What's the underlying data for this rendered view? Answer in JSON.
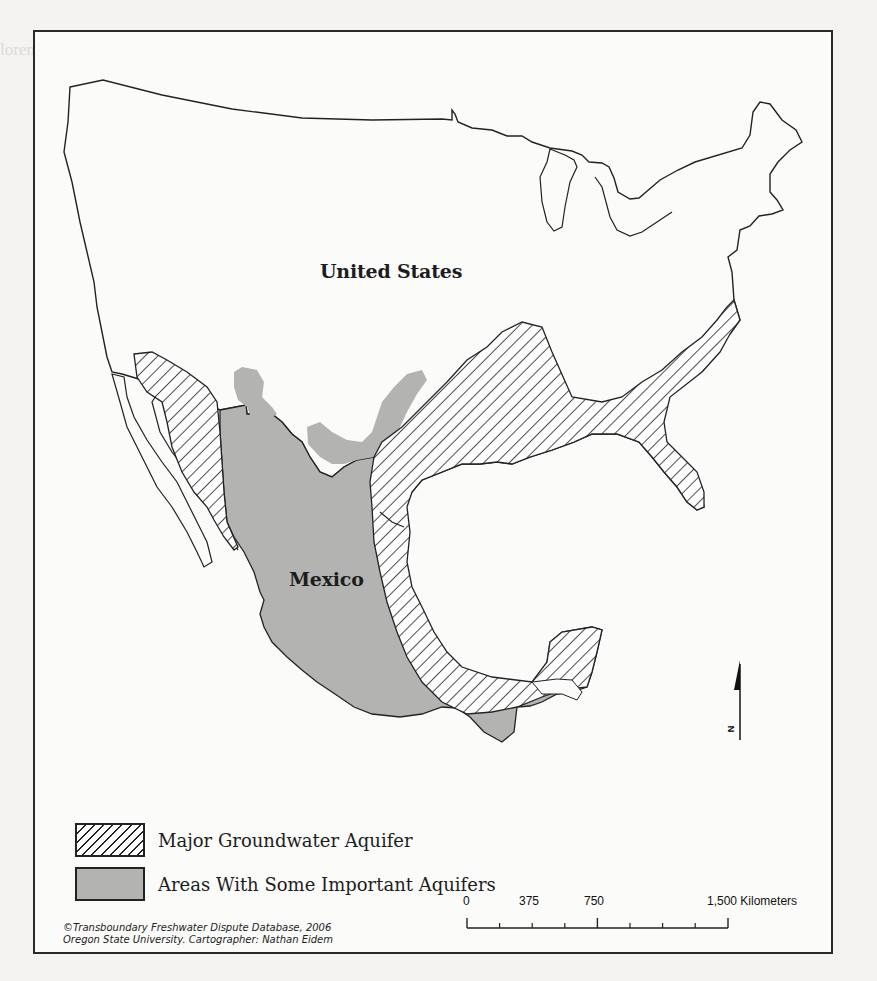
{
  "map": {
    "country_labels": {
      "us": "United States",
      "mexico": "Mexico"
    },
    "legend": [
      {
        "pattern": "hatched",
        "label": "Major Groundwater Aquifer"
      },
      {
        "pattern": "gray-fill",
        "label": "Areas With Some Important Aquifers"
      }
    ],
    "credit": {
      "line1": "©Transboundary Freshwater Dispute Database, 2006",
      "line2": "Oregon State University. Cartographer: Nathan Eidem"
    },
    "scale_bar": {
      "ticks": [
        "0",
        "375",
        "750",
        "1,500 Kilometers"
      ]
    },
    "north_arrow": {
      "label": "N"
    },
    "colors": {
      "aquifer_gray": "#b3b3b1",
      "outline": "#222222",
      "page_bg": "#f4f3f1",
      "map_bg": "#fbfbfa"
    }
  }
}
